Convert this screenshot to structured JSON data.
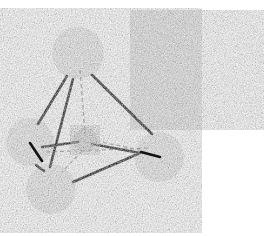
{
  "figure": {
    "background_color": "#ffffff",
    "width": 264,
    "height": 236,
    "faint_caption": ""
  },
  "palette": {
    "large_sphere_fill": "#55595a",
    "large_sphere_fill_dark": "#43474a",
    "large_sphere_fill_light": "#6a6e6f",
    "small_sphere_fill": "#1d1d1f",
    "small_sphere_fill_light": "#3a3a3c",
    "bond_color": "#111111",
    "dashed_bond_color": "#8b8b8b",
    "pale_sphere_fill": "#fbfbfb",
    "pale_sphere_shadow": "#f1f1f1",
    "pale_sphere_edge": "#ededed",
    "background": "#ffffff"
  },
  "left_model": {
    "label": "tetrahedral-interstitial-model",
    "atoms": [
      {
        "id": "top",
        "label": "large-sphere-top",
        "cx": 78,
        "cy": 53,
        "r": 26,
        "kind": "large"
      },
      {
        "id": "left",
        "label": "large-sphere-left",
        "cx": 30,
        "cy": 142,
        "r": 24,
        "kind": "large"
      },
      {
        "id": "bottom",
        "label": "large-sphere-bottom-front",
        "cx": 51,
        "cy": 189,
        "r": 25,
        "kind": "large"
      },
      {
        "id": "right",
        "label": "large-sphere-right",
        "cx": 159,
        "cy": 157,
        "r": 25,
        "kind": "large"
      },
      {
        "id": "center",
        "label": "small-sphere-interstitial",
        "cx": 85,
        "cy": 140,
        "r": 12,
        "kind": "small"
      }
    ],
    "bonds_solid": [
      {
        "from": "top",
        "to": "left",
        "label": "bond-top-left"
      },
      {
        "from": "top",
        "to": "bottom",
        "label": "bond-top-bottom"
      },
      {
        "from": "top",
        "to": "right",
        "label": "bond-top-right"
      },
      {
        "from": "left",
        "to": "bottom",
        "label": "bond-left-bottom"
      },
      {
        "from": "bottom",
        "to": "right",
        "label": "bond-bottom-right"
      },
      {
        "from": "left",
        "to": "center",
        "label": "bond-left-center"
      },
      {
        "from": "center",
        "to": "right",
        "label": "bond-center-right"
      }
    ],
    "bonds_dashed": [
      {
        "from": "top",
        "to": "center",
        "label": "dashed-bond-top-center"
      },
      {
        "from": "center",
        "to": "right",
        "label": "dashed-bond-center-right"
      },
      {
        "from": "left",
        "to": "right",
        "label": "dashed-bond-left-right"
      },
      {
        "from": "center",
        "to": "bottom",
        "label": "dashed-bond-center-bottom"
      }
    ],
    "bond_width": 2.6,
    "dashed_bond_width": 1.2,
    "dash_pattern": "4 3"
  },
  "right_model": {
    "label": "close-packed-pale-spheres",
    "spheres": [
      {
        "id": "pale-back",
        "label": "pale-sphere-top",
        "cx": 204,
        "cy": 52,
        "r": 32
      },
      {
        "id": "pale-left",
        "label": "pale-sphere-left",
        "cx": 172,
        "cy": 83,
        "r": 30
      },
      {
        "id": "pale-right",
        "label": "pale-sphere-right",
        "cx": 223,
        "cy": 88,
        "r": 32
      }
    ]
  }
}
